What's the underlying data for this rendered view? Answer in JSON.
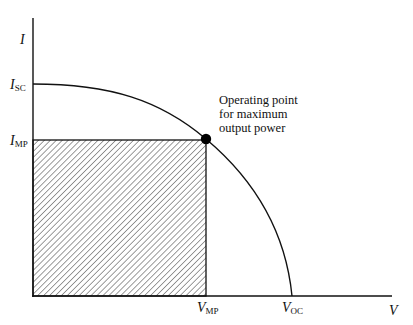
{
  "diagram": {
    "type": "I-V characteristic curve (solar cell)",
    "axes": {
      "y_label": "I",
      "x_label": "V"
    },
    "y_ticks": [
      {
        "main": "I",
        "sub": "SC",
        "meaning": "short-circuit current"
      },
      {
        "main": "I",
        "sub": "MP",
        "meaning": "current at maximum power"
      }
    ],
    "x_ticks": [
      {
        "main": "V",
        "sub": "MP",
        "meaning": "voltage at maximum power"
      },
      {
        "main": "V",
        "sub": "OC",
        "meaning": "open-circuit voltage"
      }
    ],
    "annotation": {
      "lines": [
        "Operating point",
        "for maximum",
        "output power"
      ]
    },
    "shaded_region": "rectangle from origin to (V_MP, I_MP), hatched, representing maximum power",
    "colors": {
      "line": "#111111",
      "background": "#ffffff"
    }
  }
}
